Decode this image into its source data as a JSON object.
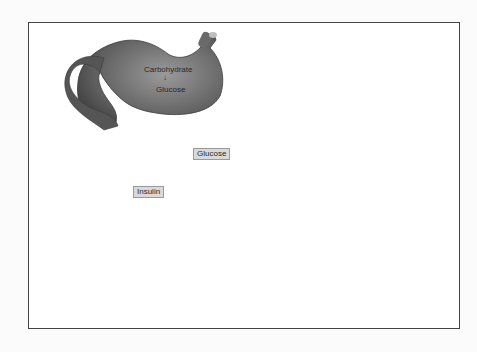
{
  "diagram": {
    "organs": [
      {
        "id": "stomach",
        "name": "Stomach"
      },
      {
        "id": "blood-vessel",
        "name": "Blood vessel"
      },
      {
        "id": "pancreas",
        "name": "Pancreas"
      },
      {
        "id": "liver",
        "name": "Liver"
      },
      {
        "id": "fat-tissue",
        "name": "Fat tissue"
      },
      {
        "id": "muscle",
        "name": "Muscle"
      }
    ],
    "labels": {
      "carbohydrate": "Carbohydrate",
      "glucose_stomach": "Glucose",
      "glucose_vessel": "Glucose",
      "insulin": "Insulin"
    },
    "colors": {
      "organ_dark": "#5a5a5a",
      "organ_mid": "#8a8a8a",
      "organ_light": "#c4c4c4",
      "arrow": "#555555",
      "frame": "#444444",
      "label_box": "#d9d9d9"
    }
  }
}
